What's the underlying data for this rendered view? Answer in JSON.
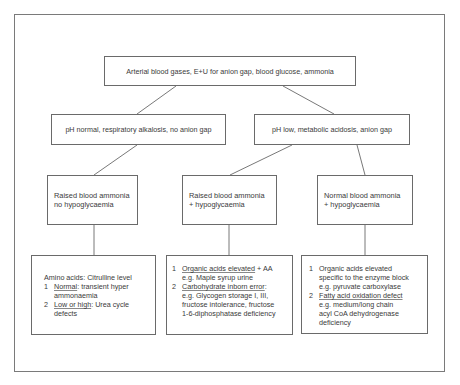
{
  "diagram": {
    "type": "flowchart",
    "root": {
      "label": "Arterial blood gases, E+U for anion gap, blood glucose, ammonia"
    },
    "branches": [
      {
        "label": "pH normal, respiratory alkalosis, no anion gap"
      },
      {
        "label": "pH low, metabolic acidosis, anion gap"
      }
    ],
    "conditions": [
      {
        "line1": "Raised blood ammonia",
        "line2": "no hypoglycaemia"
      },
      {
        "line1": "Raised blood ammonia",
        "line2": "+ hypoglycaemia"
      },
      {
        "line1": "Normal blood ammonia",
        "line2": "+ hypoglycaemia"
      }
    ],
    "outcomes": [
      {
        "heading": "Amino acids: Citrulline level",
        "items": [
          {
            "num": "1",
            "title": "Normal",
            "lines": [
              ": transient hyper",
              "ammonaemia"
            ]
          },
          {
            "num": "2",
            "title": "Low or high",
            "lines": [
              ": Urea cycle",
              "defects"
            ]
          }
        ]
      },
      {
        "items": [
          {
            "num": "1",
            "title": "Organic acids elevated",
            "lines": [
              " + AA",
              "e.g. Maple syrup urine"
            ]
          },
          {
            "num": "2",
            "title": "Carbohydrate inborn error",
            "lines": [
              ":",
              "e.g. Glycogen storage I, III,",
              "fructose intolerance, fructose",
              "1-6-diphosphatase deficiency"
            ]
          }
        ]
      },
      {
        "items": [
          {
            "num": "1",
            "title": "Organic acids elevated",
            "lines": [
              "",
              "specific to the enzyme block",
              "e.g. pyruvate carboxylase"
            ]
          },
          {
            "num": "2",
            "title": "Fatty acid oxidation defect",
            "lines": [
              "",
              "e.g. medium/long chain",
              "acyl CoA dehydrogenase",
              "deficiency"
            ]
          }
        ]
      }
    ]
  }
}
